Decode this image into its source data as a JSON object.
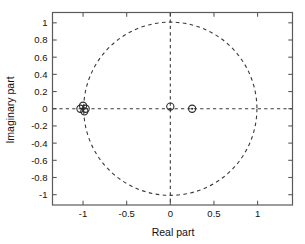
{
  "figure": {
    "background_color": "#ffffff",
    "axes_color": "#4d4d4d",
    "line_color": "#3a3a3a",
    "marker_color": "#2b2b2b"
  },
  "chart_data": {
    "type": "scatter",
    "title": "",
    "xlabel": "Real part",
    "ylabel": "Imaginary part",
    "xlim": [
      -1.35,
      1.4
    ],
    "ylim": [
      -1.12,
      1.12
    ],
    "xticks": [
      -1,
      -0.5,
      0,
      0.5,
      1
    ],
    "xticklabels": [
      "-1",
      "-0.5",
      "0",
      "0.5",
      "1"
    ],
    "yticks": [
      1,
      0.8,
      0.6,
      0.4,
      0.2,
      0,
      -0.2,
      -0.4,
      -0.6,
      -0.8,
      -1
    ],
    "yticklabels": [
      "1",
      "0.8",
      "0.6",
      "0.4",
      "0.2",
      "0",
      "-0.2",
      "-0.4",
      "-0.6",
      "-0.8",
      "-1"
    ],
    "grid": false,
    "legend": null,
    "reference_circle": {
      "name": "unit-circle",
      "center": [
        0,
        0
      ],
      "radius": 1,
      "style": "dashed"
    },
    "reference_lines": [
      {
        "name": "real-axis",
        "orientation": "horizontal",
        "value": 0,
        "style": "dashed"
      },
      {
        "name": "imaginary-axis",
        "orientation": "vertical",
        "value": 0,
        "style": "dashed"
      }
    ],
    "series": [
      {
        "name": "zeros",
        "marker": "circle",
        "x": [
          -1.03,
          -1.0,
          -0.985,
          -0.97,
          0.0,
          0.25
        ],
        "y": [
          0.0,
          0.035,
          -0.03,
          0.0,
          0.025,
          0.0
        ]
      },
      {
        "name": "poles",
        "marker": "dot",
        "x": [
          -1.0,
          0.0,
          0.25
        ],
        "y": [
          0.0,
          0.0,
          0.0
        ]
      }
    ]
  }
}
